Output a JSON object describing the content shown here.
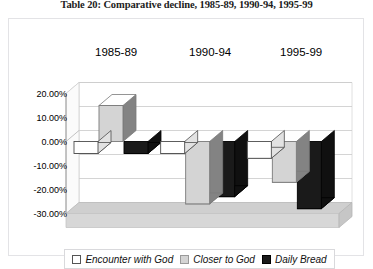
{
  "caption": "Table 20: Comparative decline, 1985-89, 1990-94, 1995-99",
  "legend": {
    "items": [
      {
        "label": "Encounter with God",
        "swatch_name": "legend-swatch-encounter-with-god",
        "color": "#ffffff",
        "border": "#555555"
      },
      {
        "label": "Closer to God",
        "swatch_name": "legend-swatch-closer-to-god",
        "color": "#d4d4d4",
        "border": "#9a9a9a"
      },
      {
        "label": "Daily Bread",
        "swatch_name": "legend-swatch-daily-bread",
        "color": "#1a1a1a",
        "border": "#000000"
      }
    ]
  },
  "chart_data": {
    "type": "bar",
    "title": "Table 20: Comparative decline, 1985-89, 1990-94, 1995-99",
    "xlabel": "",
    "ylabel": "",
    "categories": [
      "1985-89",
      "1990-94",
      "1995-99"
    ],
    "series": [
      {
        "name": "Encounter with God",
        "color": "#ffffff",
        "values": [
          -5.0,
          -5.0,
          -7.0
        ]
      },
      {
        "name": "Closer to God",
        "color": "#d4d4d4",
        "values": [
          15.0,
          -26.0,
          -17.0
        ]
      },
      {
        "name": "Daily Bread",
        "color": "#1a1a1a",
        "values": [
          -5.0,
          -23.0,
          -28.0
        ]
      }
    ],
    "yticks": [
      "20.00%",
      "10.00%",
      "0.00%",
      "-10.00%",
      "-20.00%",
      "-30.00%"
    ],
    "ytick_values": [
      20,
      10,
      0,
      -10,
      -20,
      -30
    ],
    "ylim": [
      -30,
      20
    ],
    "grid": true,
    "legend_position": "bottom",
    "three_d": true
  }
}
